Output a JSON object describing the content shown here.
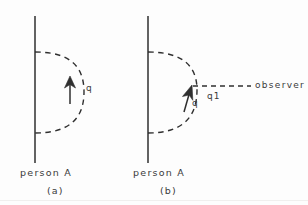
{
  "figure": {
    "background_color": "#fdfdfd",
    "ink_color": "#2f2f2f",
    "text_color": "#3a3a3a"
  },
  "panel_a": {
    "caption": "(a)",
    "person_label": "person A",
    "vector_label": "q",
    "worldline": {
      "x": 35,
      "y_top": 16,
      "y_bottom": 163
    },
    "arc": {
      "start_x": 35,
      "start_y": 52,
      "end_x": 35,
      "end_y": 133,
      "peak_x": 83,
      "style": "dashed"
    },
    "arrow": {
      "from_x": 70,
      "from_y": 103,
      "to_x": 70,
      "to_y": 77,
      "direction": "up"
    }
  },
  "panel_b": {
    "caption": "(b)",
    "person_label": "person A",
    "vector_label": "q",
    "observer_vector_label": "q1",
    "observer_label": "observer",
    "worldline": {
      "x": 148,
      "y_top": 16,
      "y_bottom": 163
    },
    "arc": {
      "start_x": 148,
      "start_y": 52,
      "end_x": 148,
      "end_y": 133,
      "peak_x": 196,
      "style": "dashed"
    },
    "arrow": {
      "from_x": 183,
      "from_y": 110,
      "to_x": 192,
      "to_y": 87,
      "direction": "up-left"
    },
    "observer_ray": {
      "from_x": 193,
      "from_y": 86,
      "to_x": 251,
      "to_y": 86,
      "style": "dashed"
    }
  }
}
